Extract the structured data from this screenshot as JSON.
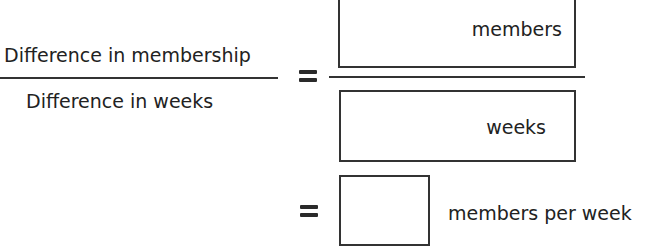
{
  "left_fraction": {
    "numerator": "Difference in membership",
    "denominator": "Difference in weeks"
  },
  "right_fraction": {
    "numerator_box": {
      "value": "",
      "unit": "members"
    },
    "denominator_box": {
      "value": "",
      "unit": "weeks"
    }
  },
  "result": {
    "value": "",
    "unit": "members per week"
  },
  "symbols": {
    "equals": "="
  }
}
